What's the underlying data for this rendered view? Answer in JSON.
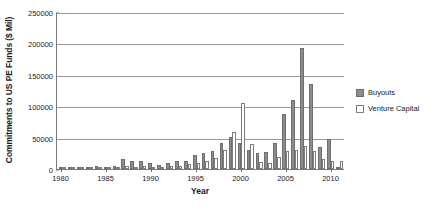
{
  "chart_data": {
    "type": "bar",
    "title": "",
    "xlabel": "Year",
    "ylabel": "Commitments to US PE Funds ($ Mil)",
    "ylim": [
      0,
      250000
    ],
    "yticks": [
      0,
      50000,
      100000,
      150000,
      200000,
      250000
    ],
    "ytick_labels": [
      "0",
      "50000",
      "100000",
      "150000",
      "200000",
      "250000"
    ],
    "xticks": [
      1980,
      1985,
      1990,
      1995,
      2000,
      2005,
      2010
    ],
    "xtick_labels": [
      "1980",
      "1985",
      "1990",
      "1995",
      "2000",
      "2005",
      "2010"
    ],
    "grid": true,
    "legend_position": "right",
    "categories": [
      "1980",
      "1981",
      "1982",
      "1983",
      "1984",
      "1985",
      "1986",
      "1987",
      "1988",
      "1989",
      "1990",
      "1991",
      "1992",
      "1993",
      "1994",
      "1995",
      "1996",
      "1997",
      "1998",
      "1999",
      "2000",
      "2001",
      "2002",
      "2003",
      "2004",
      "2005",
      "2006",
      "2007",
      "2008",
      "2009",
      "2010",
      "2011"
    ],
    "series": [
      {
        "name": "Buyouts",
        "color": "#8c8c8c",
        "values": [
          1000,
          1500,
          2000,
          3500,
          4500,
          4000,
          5000,
          15500,
          13000,
          12500,
          9000,
          6000,
          9500,
          12500,
          13500,
          22000,
          26000,
          28000,
          41000,
          51000,
          41000,
          30000,
          26000,
          27000,
          41000,
          88000,
          110000,
          193000,
          135000,
          35000,
          48000,
          1000
        ]
      },
      {
        "name": "Venture Capital",
        "color": "#ffffff",
        "values": [
          600,
          1200,
          1500,
          4000,
          3500,
          3000,
          3800,
          4500,
          4000,
          5000,
          3500,
          2000,
          5000,
          4500,
          7500,
          9500,
          12000,
          18000,
          30000,
          59000,
          105000,
          40000,
          11000,
          10000,
          19000,
          28000,
          31000,
          36000,
          28000,
          16000,
          13000,
          12000
        ]
      }
    ]
  },
  "legend": {
    "items": [
      {
        "label": "Buyouts",
        "swatch": "filled-square"
      },
      {
        "label": "Venture Capital",
        "swatch": "hollow-square"
      }
    ]
  }
}
